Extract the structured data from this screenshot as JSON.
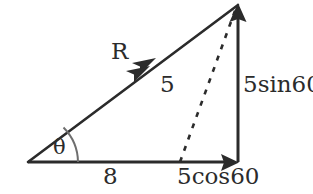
{
  "diagram": {
    "type": "vector-triangle-diagram",
    "background_color": "#ffffff",
    "stroke_color": "#2b2b2b",
    "geometry": {
      "origin_vertex": [
        28,
        162
      ],
      "apex_vertex": [
        238,
        5
      ],
      "right_angle_vertex": [
        238,
        162
      ],
      "dashed_base_point": [
        180,
        162
      ],
      "dashed_top_point": [
        236,
        8
      ]
    },
    "labels": {
      "resultant": "R",
      "angle": "θ",
      "dashed_magnitude": "5",
      "base_magnitude": "8",
      "horizontal_component": "5cos60",
      "vertical_component": "5sin60"
    },
    "icons": {
      "hypotenuse_arrow": "double-arrowhead-icon",
      "vertical_arrow": "arrowhead-up-icon",
      "horizontal_arrow": "arrowhead-right-icon",
      "angle_marker": "angle-arc-icon",
      "dashed_vector": "dashed-line-icon"
    }
  }
}
